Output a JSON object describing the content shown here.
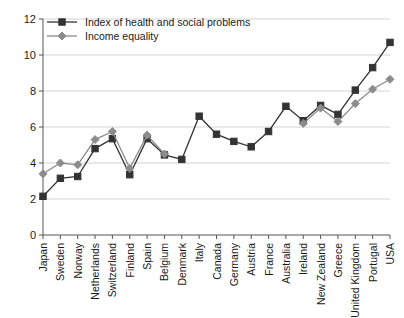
{
  "chart_data": {
    "type": "line",
    "title": "",
    "subtitle": "",
    "xlabel": "",
    "ylabel": "",
    "ylim": [
      0,
      12
    ],
    "yticks": [
      0,
      2,
      4,
      6,
      8,
      10,
      12
    ],
    "ytick_labels": [
      "0",
      "2",
      "4",
      "6",
      "8",
      "10",
      "12"
    ],
    "grid": true,
    "legend_position": "top-left",
    "categories": [
      "Japan",
      "Sweden",
      "Norway",
      "Netherlands",
      "Switzerland",
      "Finland",
      "Spain",
      "Belgium",
      "Denmark",
      "Italy",
      "Canada",
      "Germany",
      "Austria",
      "France",
      "Australia",
      "Ireland",
      "New Zealand",
      "Greece",
      "United Kingdom",
      "Portugal",
      "USA"
    ],
    "series": [
      {
        "name": "Index of health and social problems",
        "color": "#333333",
        "marker": "square",
        "values": [
          2.15,
          3.15,
          3.25,
          4.8,
          5.35,
          3.35,
          5.35,
          4.45,
          4.2,
          6.6,
          5.6,
          5.2,
          4.9,
          5.75,
          7.15,
          6.35,
          7.2,
          6.7,
          8.05,
          9.3,
          10.7
        ]
      },
      {
        "name": "Income equality",
        "color": "#8c8c8c",
        "marker": "diamond",
        "values": [
          3.4,
          4.0,
          3.9,
          5.3,
          5.75,
          3.7,
          5.55,
          4.5,
          null,
          null,
          null,
          null,
          null,
          null,
          null,
          6.2,
          7.05,
          6.3,
          7.3,
          8.1,
          8.65
        ]
      }
    ],
    "legend": [
      {
        "label": "Index of health and social problems",
        "color": "#333333",
        "marker": "square"
      },
      {
        "label": "Income equality",
        "color": "#8c8c8c",
        "marker": "diamond"
      }
    ]
  }
}
